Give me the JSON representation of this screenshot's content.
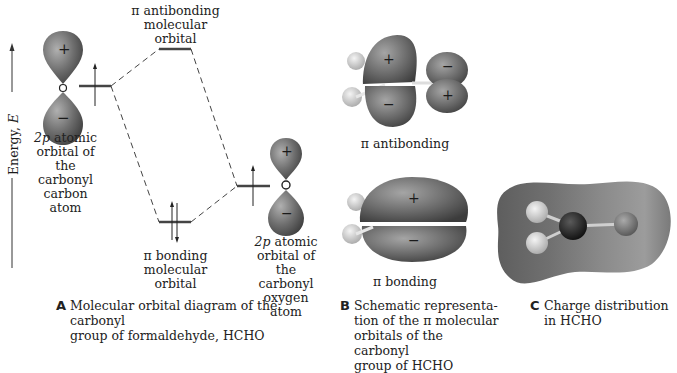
{
  "figure": {
    "axis": {
      "label": "Energy, ",
      "symbol": "E"
    },
    "panel_a": {
      "letter": "A",
      "caption": "Molecular orbital diagram of the carbonyl\ngroup of formaldehyde, HCHO",
      "antibonding_label": "π antibonding\nmolecular\norbital",
      "bonding_label": "π bonding\nmolecular\norbital",
      "carbon_label_prefix": "2p",
      "carbon_label": " atomic\norbital of the\ncarbonyl\ncarbon atom",
      "oxygen_label_prefix": "2p",
      "oxygen_label": " atomic\norbital of the\ncarbonyl\noxygen atom",
      "carbon_lobe_signs": [
        "+",
        "−"
      ],
      "oxygen_lobe_signs": [
        "+",
        "−"
      ],
      "carbon_electrons": 1,
      "oxygen_electrons": 1,
      "bonding_electrons": 2,
      "antibonding_electrons": 0
    },
    "panel_b": {
      "letter": "B",
      "caption": "Schematic representa-\ntion of the π molecular\norbitals of the carbonyl\ngroup of HCHO",
      "antibonding_label": "π antibonding",
      "bonding_label": "π bonding",
      "antibonding_signs": {
        "carbon_top": "+",
        "carbon_bottom": "−",
        "oxygen_top": "−",
        "oxygen_bottom": "+"
      },
      "bonding_signs": {
        "top": "+",
        "bottom": "−"
      }
    },
    "panel_c": {
      "letter": "C",
      "caption": "Charge distribution\nin HCHO"
    },
    "colors": {
      "lobe": "#6e6e6e",
      "lobe_light": "#a8a8a8",
      "hydrogen": "#d8d8d8",
      "carbon": "#1c1c1c",
      "oxygen": "#777777",
      "line": "#333333"
    }
  }
}
